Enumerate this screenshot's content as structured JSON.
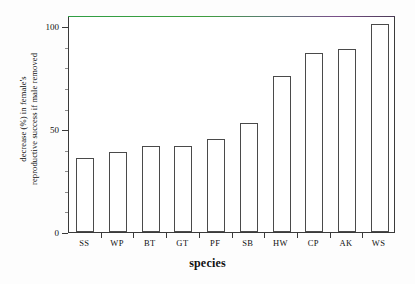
{
  "chart_data": {
    "type": "bar",
    "title": "",
    "subtitle": "",
    "xlabel": "species",
    "ylabel_line1": "decrease (%) in female's",
    "ylabel_line2": "reproductive success if male removed",
    "categories": [
      "SS",
      "WP",
      "BT",
      "GT",
      "PF",
      "SB",
      "HW",
      "CP",
      "AK",
      "WS"
    ],
    "values": [
      36,
      39,
      42,
      42,
      45,
      53,
      76,
      87,
      89,
      101
    ],
    "ylim": [
      0,
      105
    ],
    "yticks": [
      0,
      50,
      100
    ],
    "ytick_labels": [
      "0",
      "50",
      "100"
    ],
    "yminor_ticks": [
      10,
      20,
      30,
      40,
      60,
      70,
      80,
      90
    ],
    "grid": false,
    "legend": null,
    "bar_fill": "#ffffff",
    "bar_stroke": "#4a4a4a",
    "axis_color": "#3a3a3a",
    "top_rule_colors": [
      "#2f9e44",
      "#7a4f8a"
    ]
  }
}
